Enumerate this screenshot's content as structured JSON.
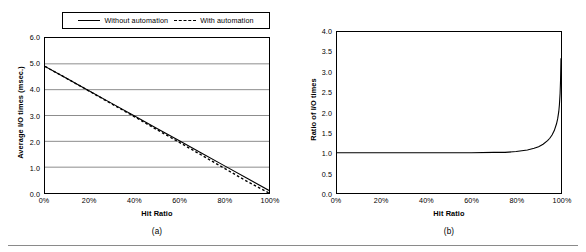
{
  "figure": {
    "panels": [
      {
        "caption": "(a)",
        "legend": {
          "entries": [
            {
              "label": "Without automation",
              "style": "solid"
            },
            {
              "label": "With automation",
              "style": "dashed"
            }
          ]
        }
      },
      {
        "caption": "(b)"
      }
    ]
  },
  "chart_data": [
    {
      "type": "line",
      "panel": "(a)",
      "title": "",
      "xlabel": "Hit Ratio",
      "ylabel": "Average I/O times (msec.)",
      "xlim": [
        0,
        100
      ],
      "ylim": [
        0.0,
        6.0
      ],
      "grid": "horizontal",
      "legend_position": "above-plot",
      "xtick_labels": [
        "0%",
        "20%",
        "40%",
        "60%",
        "80%",
        "100%"
      ],
      "xtick_values": [
        0,
        20,
        40,
        60,
        80,
        100
      ],
      "ytick_labels": [
        "0.0",
        "1.0",
        "2.0",
        "3.0",
        "4.0",
        "5.0",
        "6.0"
      ],
      "ytick_values": [
        0.0,
        1.0,
        2.0,
        3.0,
        4.0,
        5.0,
        6.0
      ],
      "x": [
        0,
        10,
        20,
        30,
        40,
        50,
        60,
        70,
        80,
        90,
        100
      ],
      "series": [
        {
          "name": "Without automation",
          "style": "solid",
          "values": [
            4.9,
            4.42,
            3.94,
            3.46,
            2.98,
            2.5,
            2.02,
            1.54,
            1.06,
            0.58,
            0.1
          ]
        },
        {
          "name": "With automation",
          "style": "dashed",
          "values": [
            4.9,
            4.42,
            3.93,
            3.44,
            2.95,
            2.45,
            1.96,
            1.46,
            0.96,
            0.46,
            0.0
          ]
        }
      ]
    },
    {
      "type": "line",
      "panel": "(b)",
      "title": "",
      "xlabel": "Hit Ratio",
      "ylabel": "Ratio of I/O times",
      "xlim": [
        0,
        100
      ],
      "ylim": [
        0.0,
        4.0
      ],
      "grid": "none",
      "xtick_labels": [
        "0%",
        "20%",
        "40%",
        "60%",
        "80%",
        "100%"
      ],
      "xtick_values": [
        0,
        20,
        40,
        60,
        80,
        100
      ],
      "ytick_labels": [
        "0.0",
        "0.5",
        "1.0",
        "1.5",
        "2.0",
        "2.5",
        "3.0",
        "3.5",
        "4.0"
      ],
      "ytick_values": [
        0.0,
        0.5,
        1.0,
        1.5,
        2.0,
        2.5,
        3.0,
        3.5,
        4.0
      ],
      "x": [
        0,
        10,
        20,
        30,
        40,
        50,
        60,
        70,
        75,
        80,
        85,
        88,
        90,
        92,
        94,
        95,
        96,
        97,
        98,
        98.5,
        99,
        99.3,
        99.6,
        99.8,
        100
      ],
      "series": [
        {
          "name": "Ratio of I/O times",
          "style": "solid",
          "values": [
            1.0,
            1.0,
            1.0,
            1.0,
            1.0,
            1.0,
            1.0,
            1.01,
            1.01,
            1.03,
            1.07,
            1.11,
            1.15,
            1.21,
            1.3,
            1.36,
            1.44,
            1.55,
            1.72,
            1.84,
            2.02,
            2.2,
            2.48,
            2.8,
            3.35
          ]
        }
      ]
    }
  ]
}
